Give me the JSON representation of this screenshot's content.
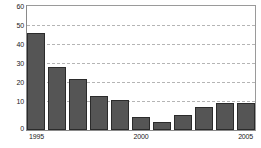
{
  "chart_data": {
    "type": "bar",
    "title": "",
    "subtitle": "",
    "xlabel": "",
    "ylabel": "",
    "ylim": [
      0,
      60
    ],
    "grid": true,
    "legend": null,
    "y_ticks": [
      0,
      10,
      20,
      30,
      40,
      50,
      60
    ],
    "y_tick_labels": [
      "0",
      "10",
      "20",
      "30",
      "40",
      "50",
      "60"
    ],
    "categories": [
      "1995",
      "1996",
      "1997",
      "1998",
      "1999",
      "2000",
      "2001",
      "2002",
      "2003",
      "2004",
      "2005"
    ],
    "x_tick_labels": [
      "1995",
      "2000",
      "2005"
    ],
    "x_tick_categories": [
      "1995",
      "2000",
      "2005"
    ],
    "values": [
      51,
      33,
      27,
      18,
      16,
      7,
      4,
      8,
      12,
      14,
      14
    ],
    "series": [
      {
        "name": "",
        "values": [
          51,
          33,
          27,
          18,
          16,
          7,
          4,
          8,
          12,
          14,
          14
        ],
        "color": "#555555"
      }
    ],
    "colors": {
      "bar_fill": "#555555",
      "bar_edge": "#2b2b2b",
      "gridline": "#b5b5b5",
      "axis": "#8a8a8a",
      "text": "#1a1a1a",
      "background": "#ffffff"
    }
  }
}
